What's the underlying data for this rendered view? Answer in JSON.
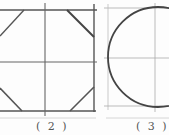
{
  "figures": [
    {
      "id": "fig2",
      "label": "( 2 )",
      "shape": "octagon inscribed in square with center guide lines"
    },
    {
      "id": "fig3",
      "label": "( 3 )",
      "shape": "circle inscribed in square with center guide lines"
    }
  ],
  "colors": {
    "stroke": "#4a4a4a",
    "guide": "#9a9a9a",
    "separator": "#c8c8c8"
  }
}
